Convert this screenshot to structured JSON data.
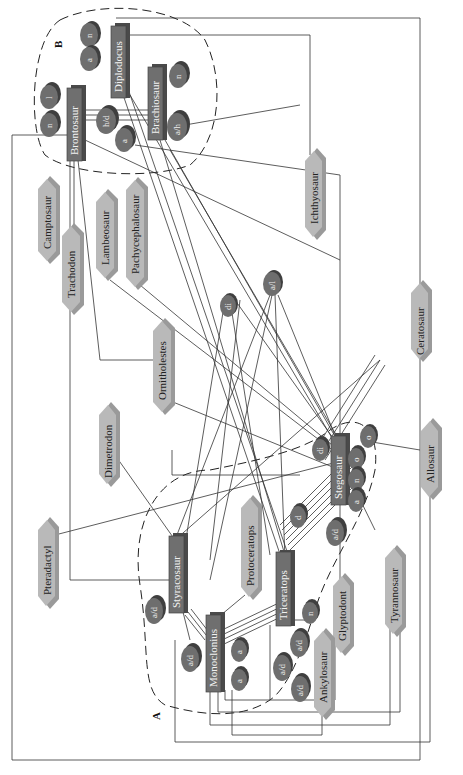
{
  "diagram": {
    "group_labels": {
      "A": "A",
      "B": "B"
    },
    "main_nodes": {
      "diplodocus": "Diplodocus",
      "brachiosaur": "Brachiosaur",
      "brontosaur": "Brontosaur",
      "styracosaur": "Styracosaur",
      "monoclonius": "Monoclonius",
      "triceratops": "Triceratops",
      "stegosaur": "Stegosaur"
    },
    "attribute_nodes": {
      "diplodocus_n": "n",
      "diplodocus_a": "a",
      "brachiosaur_n": "n",
      "brachiosaur_ah": "a/h",
      "brontosaur_l": "l",
      "brontosaur_n": "n",
      "shared_hd": "h/d",
      "shared_a": "a",
      "mid_di": "di",
      "mid_al": "a/l",
      "stegosaur_di": "di",
      "stegosaur_o1": "o",
      "stegosaur_o2": "o",
      "stegosaur_n": "n",
      "stegosaur_a": "a",
      "stegosaur_ad": "a/d",
      "triceratops_d": "d",
      "triceratops_n": "n",
      "triceratops_ad1": "a/d",
      "triceratops_ad2": "a/d",
      "triceratops_ad3": "a/d",
      "styracosaur_ad": "a/d",
      "monoclonius_ad": "a/d",
      "monoclonius_a1": "a",
      "monoclonius_a2": "a"
    },
    "outer_nodes": {
      "camptosaur": "Camptosaur",
      "trachodon": "Trachodon",
      "lambeosaur": "Lambeosaur",
      "pachycephalosaur": "Pachycephalosaur",
      "ichthyosaur": "Ichthyosaur",
      "ornitholestes": "Ornitholestes",
      "ceratosaur": "Ceratosaur",
      "dimetrodon": "Dimetrodon",
      "pteradactyl": "Pteradactyl",
      "protoceratops": "Protoceratops",
      "allosaur": "Allosaur",
      "tyrannosaur": "Tyrannosaur",
      "glyptodont": "Glyptodont",
      "ankylosaur": "Ankylosaur"
    }
  }
}
